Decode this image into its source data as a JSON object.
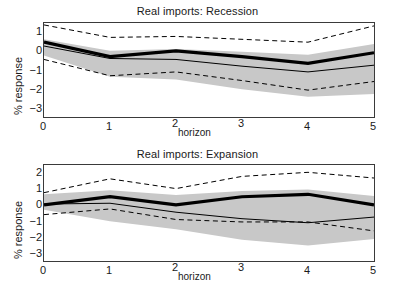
{
  "figure": {
    "background": "#ffffff",
    "band_color": "#c8c8c8",
    "line_color": "#000000",
    "axis_color": "#3a3a3a"
  },
  "panels": [
    {
      "key": "recession",
      "title": "Real imports: Recession",
      "ylabel": "% response",
      "xlabel": "horizon",
      "yticks": [
        "1",
        "0",
        "−1",
        "−2",
        "−3"
      ],
      "xticks": [
        "0",
        "1",
        "2",
        "3",
        "4",
        "5"
      ]
    },
    {
      "key": "expansion",
      "title": "Real imports: Expansion",
      "ylabel": "% response",
      "xlabel": "horizon",
      "yticks": [
        "2",
        "1",
        "0",
        "−1",
        "−2",
        "−3"
      ],
      "xticks": [
        "0",
        "1",
        "2",
        "3",
        "4",
        "5"
      ]
    }
  ],
  "chart_data": [
    {
      "type": "line",
      "title": "Real imports: Recession",
      "xlabel": "horizon",
      "ylabel": "% response",
      "x": [
        0,
        1,
        2,
        3,
        4,
        5
      ],
      "xlim": [
        0,
        5
      ],
      "ylim": [
        -3.45,
        1.45
      ],
      "ytick_values": [
        1,
        0,
        -1,
        -2,
        -3
      ],
      "xtick_values": [
        0,
        1,
        2,
        3,
        4,
        5
      ],
      "grid": false,
      "legend": "none",
      "series": [
        {
          "name": "impulse response (thick solid)",
          "style": "solid-thick",
          "values": [
            0.45,
            -0.3,
            0.0,
            -0.3,
            -0.65,
            -0.1
          ]
        },
        {
          "name": "alternative estimate (thin solid)",
          "style": "solid-thin",
          "values": [
            0.25,
            -0.4,
            -0.45,
            -0.8,
            -1.1,
            -0.75
          ]
        },
        {
          "name": "upper confidence band (dashed)",
          "style": "dashed",
          "values": [
            1.35,
            0.7,
            0.75,
            0.6,
            0.45,
            1.3
          ]
        },
        {
          "name": "lower confidence band (dashed)",
          "style": "dashed",
          "values": [
            -0.45,
            -1.3,
            -1.1,
            -1.55,
            -2.05,
            -1.6
          ]
        }
      ],
      "shaded_band": {
        "name": "confidence interval (gray fill)",
        "color": "#c8c8c8",
        "upper": [
          0.6,
          0.0,
          0.1,
          -0.05,
          -0.2,
          0.35
        ],
        "lower": [
          -0.25,
          -1.35,
          -1.5,
          -2.0,
          -2.4,
          -2.25
        ]
      }
    },
    {
      "type": "line",
      "title": "Real imports: Expansion",
      "xlabel": "horizon",
      "ylabel": "% response",
      "x": [
        0,
        1,
        2,
        3,
        4,
        5
      ],
      "xlim": [
        0,
        5
      ],
      "ylim": [
        -3.45,
        2.45
      ],
      "ytick_values": [
        2,
        1,
        0,
        -1,
        -2,
        -3
      ],
      "xtick_values": [
        0,
        1,
        2,
        3,
        4,
        5
      ],
      "grid": false,
      "legend": "none",
      "series": [
        {
          "name": "impulse response (thick solid)",
          "style": "solid-thick",
          "values": [
            0.0,
            0.5,
            0.0,
            0.5,
            0.65,
            0.0
          ]
        },
        {
          "name": "alternative estimate (thin solid)",
          "style": "solid-thin",
          "values": [
            0.05,
            0.1,
            -0.45,
            -0.85,
            -1.1,
            -0.75
          ]
        },
        {
          "name": "upper confidence band (dashed)",
          "style": "dashed",
          "values": [
            0.75,
            1.6,
            1.0,
            1.75,
            2.0,
            1.65
          ]
        },
        {
          "name": "lower confidence band (dashed)",
          "style": "dashed",
          "values": [
            -0.6,
            -0.25,
            -0.9,
            -1.05,
            -1.05,
            -1.6
          ]
        }
      ],
      "shaded_band": {
        "name": "confidence interval (gray fill)",
        "color": "#c8c8c8",
        "upper": [
          0.65,
          0.9,
          0.6,
          0.85,
          0.95,
          0.55
        ],
        "lower": [
          -0.3,
          -1.0,
          -1.5,
          -2.15,
          -2.5,
          -2.1
        ]
      }
    }
  ]
}
